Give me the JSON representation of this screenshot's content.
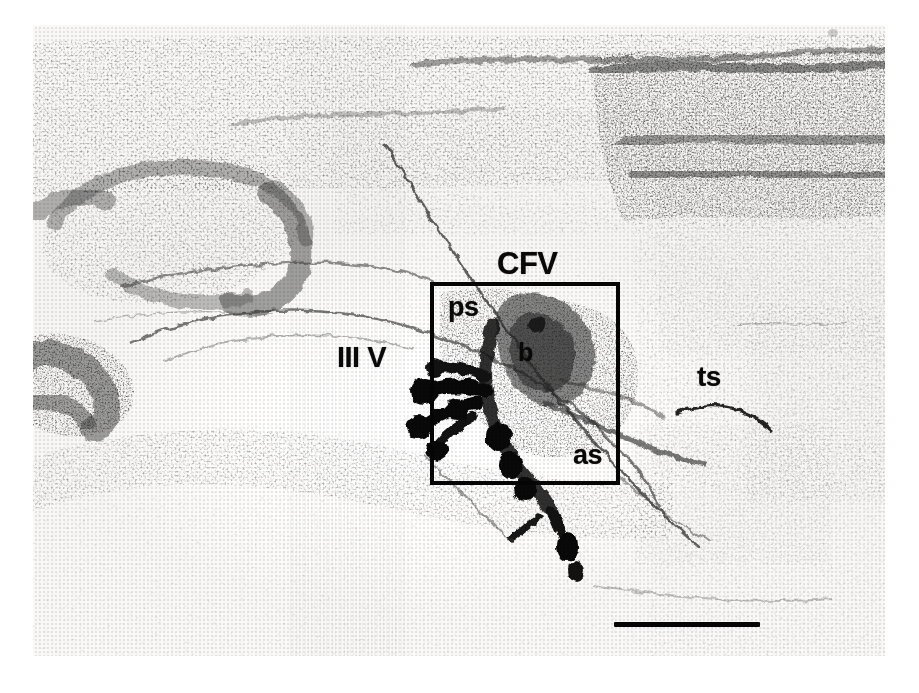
{
  "figure": {
    "type": "photomicrograph",
    "modality": "brightfield light microscopy of a stained coronal brain section",
    "plate": {
      "left": 33,
      "top": 25,
      "width": 852,
      "height": 631,
      "background_color": "#f2f1ef",
      "ink_color": "#1a1a1a"
    }
  },
  "labels": [
    {
      "id": "cfv",
      "text": "CFV",
      "x": 497,
      "y": 248,
      "font_size": 31,
      "description": "label above the inset box, abbreviation for the ventral column / commissural fiber bundle"
    },
    {
      "id": "ps",
      "text": "ps",
      "x": 448,
      "y": 294,
      "font_size": 27,
      "description": "posterior segment label inside the upper-left of the inset box"
    },
    {
      "id": "b",
      "text": "b",
      "x": 518,
      "y": 340,
      "font_size": 25,
      "description": "body label on the dense stained cluster at the centre of the inset box"
    },
    {
      "id": "as",
      "text": "as",
      "x": 573,
      "y": 442,
      "font_size": 27,
      "description": "anterior segment label in the lower-right of the inset box"
    },
    {
      "id": "third-ventricle",
      "text": "III V",
      "x": 337,
      "y": 343,
      "font_size": 29,
      "description": "third ventricle label, left of the inset box"
    },
    {
      "id": "ts",
      "text": "ts",
      "x": 697,
      "y": 363,
      "font_size": 28,
      "description": "tract label on the right side of the section above a thin curved fibre line"
    }
  ],
  "inset_box": {
    "name": "region-of-interest-box",
    "left": 430,
    "top": 282,
    "width": 190,
    "height": 203,
    "stroke_width": 4,
    "stroke_color": "#0a0a0a",
    "description": "solid black rectangle outlining the magnified region containing ps, b and as"
  },
  "scale_bar": {
    "left": 614,
    "top": 622,
    "width": 146,
    "height": 5,
    "color": "#0a0a0a",
    "label": "",
    "description": "unlabelled horizontal calibration bar in the lower right of the plate"
  },
  "anatomy": {
    "regions": [
      {
        "name": "dorsal-cortical-band",
        "description": "horizontally layered densely stained band across the top of the section, darkening toward the right"
      },
      {
        "name": "left-nucleus-oval",
        "description": "large oval cluster of darkly stained cell bodies in the upper-left quadrant"
      },
      {
        "name": "left-lower-nucleus",
        "description": "second darkly stained cell cluster at the mid-left edge"
      },
      {
        "name": "ventricular-clear-zone",
        "description": "pale unstained lumen of the third ventricle in the centre-left"
      },
      {
        "name": "stained-cluster",
        "description": "intensely stained arborizing structure inside the inset box, extending below it"
      },
      {
        "name": "ventral-grey",
        "description": "broad stippled grey field occupying the lower half of the section"
      },
      {
        "name": "right-field",
        "description": "moderately stippled tissue at the right of the section surrounding the ts label"
      }
    ],
    "artifacts": [
      {
        "name": "diagonal-crack",
        "description": "thin dark sectioning crack running from the upper middle down through the inset box and toward the lower right"
      },
      {
        "name": "ts-fibre-line",
        "description": "short thin curved dark line beneath the ts label"
      },
      {
        "name": "corner-speck",
        "description": "faint small mark near the top right of the plate"
      }
    ]
  }
}
